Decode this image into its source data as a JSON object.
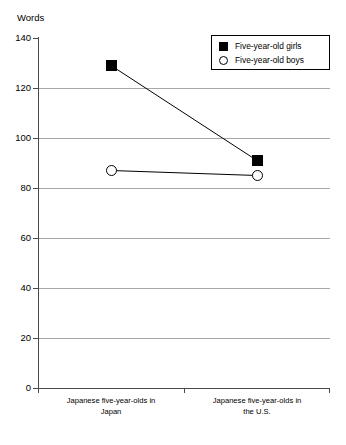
{
  "chart_data": {
    "type": "line",
    "title": "",
    "ylabel": "Words",
    "xlabel": "",
    "ylim": [
      0,
      140
    ],
    "yticks": [
      0,
      20,
      40,
      60,
      80,
      100,
      120,
      140
    ],
    "grid": true,
    "legend_position": "top-right",
    "categories": [
      "Japanese five-year-olds in\nJapan",
      "Japanese five-year-olds in\nthe U.S."
    ],
    "category_lines": [
      [
        "Japanese five-year-olds in",
        "Japan"
      ],
      [
        "Japanese five-year-olds in",
        "the U.S."
      ]
    ],
    "series": [
      {
        "name": "Five-year-old girls",
        "marker": "filled-square",
        "color": "#000000",
        "values": [
          129,
          91
        ]
      },
      {
        "name": "Five-year-old boys",
        "marker": "open-circle",
        "color": "#000000",
        "values": [
          87,
          85
        ]
      }
    ]
  },
  "legend": {
    "entries": [
      {
        "label": "Five-year-old girls",
        "marker": "filled-square"
      },
      {
        "label": "Five-year-old boys",
        "marker": "open-circle"
      }
    ]
  },
  "axis": {
    "y_title": "Words",
    "y_tick_labels": [
      "140",
      "120",
      "100",
      "80",
      "60",
      "40",
      "20",
      "0"
    ]
  },
  "colors": {
    "grid": "#a8a8a8",
    "axis": "#4a4a4a",
    "series": "#000000",
    "background": "#ffffff"
  }
}
